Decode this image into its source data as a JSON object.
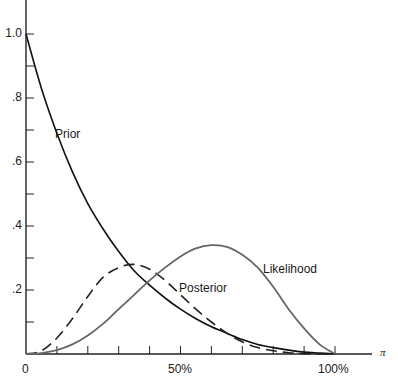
{
  "chart_data": {
    "type": "line",
    "title": "",
    "xlabel": "π",
    "ylabel": "",
    "xlim": [
      0,
      1.2
    ],
    "ylim": [
      0,
      1.1
    ],
    "grid": false,
    "legend_position": "inline labels",
    "x_tick_labels": [
      "0",
      "50%",
      "100%"
    ],
    "x_minor_ticks": [
      0.1,
      0.2,
      0.3,
      0.4,
      0.5,
      0.6,
      0.7,
      0.8,
      0.9,
      1.0
    ],
    "y_tick_labels": [
      ".2",
      ".4",
      ".6",
      ".8",
      "1.0"
    ],
    "y_minor_ticks": [
      0.1,
      0.2,
      0.3,
      0.4,
      0.5,
      0.6,
      0.7,
      0.8,
      0.9,
      1.0
    ],
    "x": [
      0,
      0.05,
      0.1,
      0.15,
      0.2,
      0.25,
      0.3,
      0.35,
      0.4,
      0.45,
      0.5,
      0.55,
      0.6,
      0.65,
      0.7,
      0.75,
      0.8,
      0.85,
      0.9,
      0.95,
      1.0
    ],
    "series": [
      {
        "name": "Prior",
        "style": "solid",
        "color": "#111111",
        "values": [
          1.0,
          0.83,
          0.69,
          0.57,
          0.47,
          0.39,
          0.32,
          0.26,
          0.215,
          0.175,
          0.14,
          0.11,
          0.085,
          0.065,
          0.045,
          0.03,
          0.02,
          0.012,
          0.006,
          0.003,
          0.0
        ]
      },
      {
        "name": "Posterior",
        "style": "dashed",
        "color": "#222222",
        "values": [
          0.0,
          0.01,
          0.05,
          0.11,
          0.18,
          0.24,
          0.27,
          0.28,
          0.265,
          0.23,
          0.185,
          0.14,
          0.1,
          0.065,
          0.038,
          0.02,
          0.01,
          0.004,
          0.001,
          0.0,
          0.0
        ]
      },
      {
        "name": "Likelihood",
        "style": "solid",
        "color": "#666666",
        "values": [
          0.0,
          0.003,
          0.012,
          0.03,
          0.058,
          0.095,
          0.14,
          0.185,
          0.23,
          0.27,
          0.305,
          0.33,
          0.34,
          0.335,
          0.31,
          0.27,
          0.21,
          0.14,
          0.08,
          0.03,
          0.0
        ]
      }
    ],
    "annotations": [
      {
        "text": "Prior",
        "x": 0.07,
        "y": 0.68
      },
      {
        "text": "Posterior",
        "x": 0.48,
        "y": 0.2
      },
      {
        "text": "Likelihood",
        "x": 0.7,
        "y": 0.27
      }
    ]
  },
  "axis": {
    "x_symbol": "π",
    "x_labels": {
      "zero": "0",
      "half": "50%",
      "full": "100%"
    },
    "y_labels": {
      "p2": ".2",
      "p4": ".4",
      "p6": ".6",
      "p8": ".8",
      "p10": "1.0"
    }
  },
  "labels": {
    "prior": "Prior",
    "posterior": "Posterior",
    "likelihood": "Likelihood"
  }
}
